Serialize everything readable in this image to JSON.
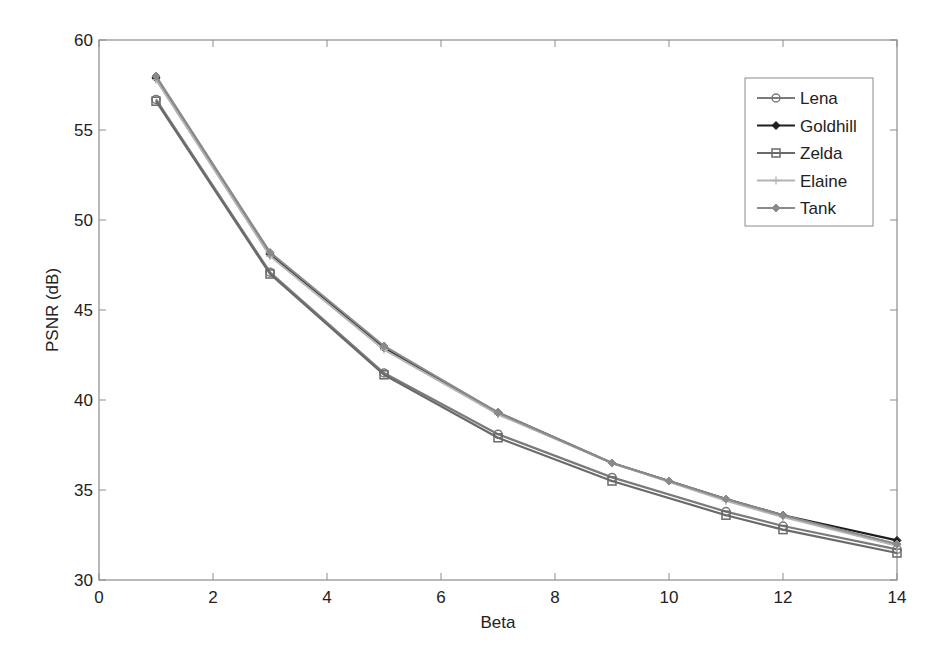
{
  "chart_data": {
    "type": "line",
    "title": "",
    "xlabel": "Beta",
    "ylabel": "PSNR (dB)",
    "xlim": [
      0,
      14
    ],
    "ylim": [
      30,
      60
    ],
    "xticks": [
      0,
      2,
      4,
      6,
      8,
      10,
      12,
      14
    ],
    "yticks": [
      30,
      35,
      40,
      45,
      50,
      55,
      60
    ],
    "grid": false,
    "legend_position": "upper right",
    "x": [
      1,
      3,
      5,
      7,
      9,
      11,
      12,
      14
    ],
    "series": [
      {
        "name": "Lena",
        "marker": "circle",
        "color": "#7a7a7a",
        "x": [
          1,
          3,
          5,
          7,
          9,
          11,
          12,
          14
        ],
        "values": [
          56.7,
          47.1,
          41.5,
          38.1,
          35.7,
          33.8,
          33.0,
          31.7
        ]
      },
      {
        "name": "Goldhill",
        "marker": "diamond-filled",
        "color": "#1e1e1e",
        "x": [
          1,
          3,
          5,
          7,
          9,
          11,
          12,
          14
        ],
        "values": [
          57.9,
          48.1,
          42.9,
          39.3,
          36.5,
          34.5,
          33.6,
          32.2
        ]
      },
      {
        "name": "Zelda",
        "marker": "square",
        "color": "#6a6a6a",
        "x": [
          1,
          3,
          5,
          7,
          9,
          11,
          12,
          14
        ],
        "values": [
          56.6,
          47.0,
          41.4,
          37.9,
          35.5,
          33.6,
          32.8,
          31.5
        ]
      },
      {
        "name": "Elaine",
        "marker": "plus",
        "color": "#b4b4b4",
        "x": [
          1,
          3,
          5,
          7,
          9,
          11,
          12,
          14
        ],
        "values": [
          57.8,
          48.0,
          42.8,
          39.2,
          36.5,
          34.4,
          33.5,
          31.9
        ]
      },
      {
        "name": "Tank",
        "marker": "diamond",
        "color": "#8a8a8a",
        "x": [
          1,
          3,
          5,
          7,
          9,
          10,
          11,
          12,
          14
        ],
        "values": [
          58.0,
          48.2,
          43.0,
          39.3,
          36.5,
          35.5,
          34.5,
          33.6,
          32.0
        ]
      }
    ]
  },
  "legend": {
    "items": [
      "Lena",
      "Goldhill",
      "Zelda",
      "Elaine",
      "Tank"
    ]
  },
  "axes": {
    "xlabel": "Beta",
    "ylabel": "PSNR (dB)"
  }
}
